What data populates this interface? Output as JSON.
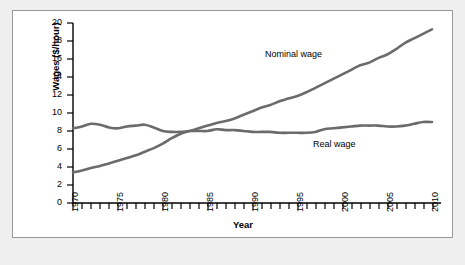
{
  "chart_data": {
    "type": "line",
    "title": "",
    "xlabel": "Year",
    "ylabel": "Wages ($/hour)",
    "xlim": [
      1970,
      2011
    ],
    "ylim": [
      0,
      20
    ],
    "yticks": [
      0,
      2,
      4,
      6,
      8,
      10,
      12,
      14,
      16,
      18,
      20
    ],
    "xticks": [
      1970,
      1975,
      1980,
      1985,
      1990,
      1995,
      2000,
      2005,
      2010
    ],
    "xtick_labels": [
      "1970",
      "1975",
      "1980",
      "1985",
      "1990",
      "1995",
      "2000",
      "2005",
      "2010"
    ],
    "ytick_labels": [
      "0",
      "2",
      "4",
      "6",
      "8",
      "10",
      "12",
      "14",
      "16",
      "18",
      "20"
    ],
    "grid": false,
    "legend_position": "inline-annotations",
    "line_color": "#6b6b6b",
    "frame_color": "#9a9a9a",
    "background": "#ffffff",
    "outer_background": "#efefef",
    "x": [
      1970,
      1971,
      1972,
      1973,
      1974,
      1975,
      1976,
      1977,
      1978,
      1979,
      1980,
      1981,
      1982,
      1983,
      1984,
      1985,
      1986,
      1987,
      1988,
      1989,
      1990,
      1991,
      1992,
      1993,
      1994,
      1995,
      1996,
      1997,
      1998,
      1999,
      2000,
      2001,
      2002,
      2003,
      2004,
      2005,
      2006,
      2007,
      2008,
      2009,
      2010
    ],
    "series": [
      {
        "name": "Nominal wage",
        "label": "Nominal wage",
        "values": [
          3.4,
          3.6,
          3.9,
          4.1,
          4.4,
          4.7,
          5.0,
          5.3,
          5.7,
          6.1,
          6.6,
          7.2,
          7.7,
          8.0,
          8.3,
          8.6,
          8.9,
          9.1,
          9.4,
          9.8,
          10.2,
          10.6,
          10.9,
          11.3,
          11.6,
          11.9,
          12.3,
          12.8,
          13.3,
          13.8,
          14.3,
          14.8,
          15.3,
          15.6,
          16.1,
          16.5,
          17.1,
          17.8,
          18.3,
          18.8,
          19.3
        ]
      },
      {
        "name": "Real wage",
        "label": "Real wage",
        "values": [
          8.3,
          8.5,
          8.8,
          8.7,
          8.4,
          8.3,
          8.5,
          8.6,
          8.7,
          8.4,
          8.0,
          7.9,
          7.9,
          8.0,
          8.0,
          8.0,
          8.2,
          8.1,
          8.1,
          8.0,
          7.9,
          7.9,
          7.9,
          7.8,
          7.8,
          7.8,
          7.8,
          7.9,
          8.2,
          8.3,
          8.4,
          8.5,
          8.6,
          8.6,
          8.6,
          8.5,
          8.5,
          8.6,
          8.8,
          9.0,
          9.0
        ]
      }
    ]
  }
}
